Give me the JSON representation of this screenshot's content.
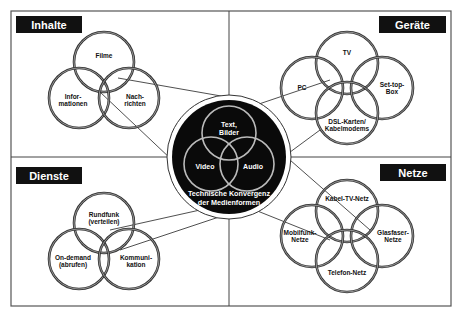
{
  "diagram": {
    "title_center": [
      "Technische Konvergenz",
      "der Medienformen"
    ],
    "center_circles": [
      {
        "label": [
          "Text,",
          "Bilder"
        ],
        "cx": 229,
        "cy": 133,
        "r": 27
      },
      {
        "label": [
          "Video"
        ],
        "cx": 211,
        "cy": 164,
        "r": 27
      },
      {
        "label": [
          "Audio"
        ],
        "cx": 247,
        "cy": 164,
        "r": 27
      }
    ],
    "quadrants": [
      {
        "id": "inhalte",
        "title": "Inhalte",
        "circles": [
          {
            "label": [
              "Filme"
            ],
            "cx": 104,
            "cy": 62,
            "r": 30
          },
          {
            "label": [
              "Infor-",
              "mationen"
            ],
            "cx": 79,
            "cy": 98,
            "r": 30
          },
          {
            "label": [
              "Nach-",
              "richten"
            ],
            "cx": 129,
            "cy": 98,
            "r": 30
          }
        ]
      },
      {
        "id": "geraete",
        "title": "Geräte",
        "circles": [
          {
            "label": [
              "TV"
            ],
            "cx": 347,
            "cy": 63,
            "r": 31
          },
          {
            "label": [
              "PC"
            ],
            "cx": 312,
            "cy": 88,
            "r": 31
          },
          {
            "label": [
              "Set-top-",
              "Box"
            ],
            "cx": 382,
            "cy": 88,
            "r": 31
          },
          {
            "label": [
              "DSL-Karten/",
              "Kabelmodems"
            ],
            "cx": 347,
            "cy": 113,
            "r": 31
          }
        ]
      },
      {
        "id": "dienste",
        "title": "Dienste",
        "circles": [
          {
            "label": [
              "Rundfunk",
              "(verteilen)"
            ],
            "cx": 104,
            "cy": 223,
            "r": 30
          },
          {
            "label": [
              "On-demand",
              "(abrufen)"
            ],
            "cx": 79,
            "cy": 259,
            "r": 30
          },
          {
            "label": [
              "Kommuni-",
              "kation"
            ],
            "cx": 129,
            "cy": 259,
            "r": 30
          }
        ]
      },
      {
        "id": "netze",
        "title": "Netze",
        "circles": [
          {
            "label": [
              "Kabel-TV-Netz"
            ],
            "cx": 347,
            "cy": 211,
            "r": 31
          },
          {
            "label": [
              "Mobilfunk-",
              "Netze"
            ],
            "cx": 312,
            "cy": 236,
            "r": 31
          },
          {
            "label": [
              "Glasfaser-",
              "Netze"
            ],
            "cx": 382,
            "cy": 236,
            "r": 31
          },
          {
            "label": [
              "Telefon-Netz"
            ],
            "cx": 347,
            "cy": 261,
            "r": 31
          }
        ]
      }
    ],
    "colors": {
      "background": "#ffffff",
      "frame": "#555555",
      "label_box": "#111111",
      "label_text": "#ffffff",
      "ring": "#333333",
      "center_fill": "#0a0a0a",
      "center_text": "#ffffff"
    }
  }
}
